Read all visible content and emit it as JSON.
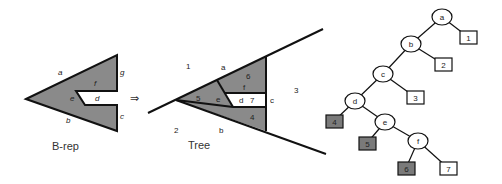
{
  "colors": {
    "fill_gray": "#8a8a8a",
    "leaf_gray": "#7a7a7a",
    "line": "#111111",
    "white": "#ffffff"
  },
  "brep": {
    "caption": "B-rep",
    "edges": {
      "a": "a",
      "b": "b",
      "c": "c",
      "d": "d",
      "e": "e",
      "f": "f",
      "g": "g"
    }
  },
  "arrow": "⇒",
  "tree_panel": {
    "caption": "Tree",
    "regions": {
      "r1": "1",
      "r2": "2",
      "r3": "3",
      "r4": "4",
      "r5": "5",
      "r6": "6",
      "r7": "7"
    },
    "edges": {
      "a": "a",
      "b": "b",
      "c": "c",
      "d": "d",
      "e": "e",
      "f": "f"
    }
  },
  "bsp_tree": {
    "internal_nodes": [
      "a",
      "b",
      "c",
      "d",
      "e",
      "f"
    ],
    "leaves": [
      {
        "label": "1",
        "filled": false
      },
      {
        "label": "2",
        "filled": false
      },
      {
        "label": "3",
        "filled": false
      },
      {
        "label": "4",
        "filled": true
      },
      {
        "label": "5",
        "filled": true
      },
      {
        "label": "6",
        "filled": true
      },
      {
        "label": "7",
        "filled": false
      }
    ]
  }
}
